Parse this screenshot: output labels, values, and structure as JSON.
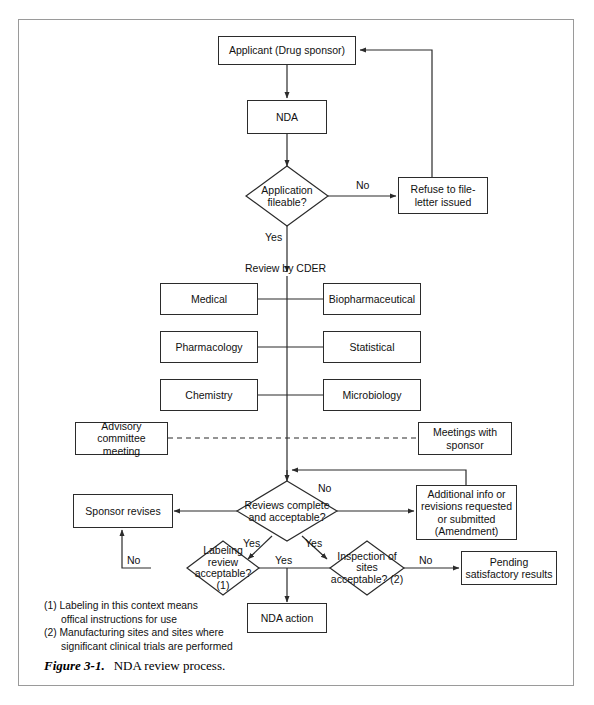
{
  "figure": {
    "number": "Figure 3-1.",
    "title": "NDA review process."
  },
  "nodes": {
    "applicant": "Applicant (Drug sponsor)",
    "nda": "NDA",
    "application_fileable": "Application fileable?",
    "refuse_to_file": "Refuse to file-letter issued",
    "review_by_cder": "Review by CDER",
    "medical": "Medical",
    "biopharmaceutical": "Biopharmaceutical",
    "pharmacology": "Pharmacology",
    "statistical": "Statistical",
    "chemistry": "Chemistry",
    "microbiology": "Microbiology",
    "advisory_committee": "Advisory committee meeting",
    "meetings_with_sponsor": "Meetings with sponsor",
    "reviews_complete": "Reviews complete and acceptable?",
    "sponsor_revises": "Sponsor revises",
    "additional_info": "Additional info or revisions requested or submitted (Amendment)",
    "labeling_review": "Labeling review acceptable? (1)",
    "inspection_of_sites": "Inspection of sites acceptable? (2)",
    "pending_results": "Pending satisfactory results",
    "nda_action": "NDA action"
  },
  "node_lines": {
    "applicant": [
      "Applicant (Drug sponsor)"
    ],
    "nda": [
      "NDA"
    ],
    "application_fileable": [
      "Application",
      "fileable?"
    ],
    "refuse_to_file": [
      "Refuse to file-",
      "letter issued"
    ],
    "medical": [
      "Medical"
    ],
    "biopharmaceutical": [
      "Biopharmaceutical"
    ],
    "pharmacology": [
      "Pharmacology"
    ],
    "statistical": [
      "Statistical"
    ],
    "chemistry": [
      "Chemistry"
    ],
    "microbiology": [
      "Microbiology"
    ],
    "advisory_committee": [
      "Advisory",
      "committee meeting"
    ],
    "meetings_with_sponsor": [
      "Meetings with",
      "sponsor"
    ],
    "reviews_complete": [
      "Reviews",
      "complete and",
      "acceptable?"
    ],
    "sponsor_revises": [
      "Sponsor revises"
    ],
    "additional_info": [
      "Additional info or",
      "revisions requested",
      "or submitted",
      "(Amendment)"
    ],
    "labeling_review": [
      "Labeling",
      "review",
      "acceptable?",
      "(1)"
    ],
    "inspection_of_sites": [
      "Inspection",
      "of sites",
      "acceptable?",
      "(2)"
    ],
    "pending_results": [
      "Pending",
      "satisfactory results"
    ],
    "nda_action": [
      "NDA action"
    ]
  },
  "edge_labels": {
    "fileable_no": "No",
    "fileable_yes": "Yes",
    "reviews_no": "No",
    "reviews_yes_left": "Yes",
    "reviews_yes_right": "Yes",
    "labeling_no": "No",
    "labeling_yes": "Yes",
    "inspection_no": "No"
  },
  "footnotes": [
    "(1) Labeling in this context means",
    "offical instructions for use",
    "(2) Manufacturing sites and sites where",
    "significant clinical trials are performed"
  ],
  "colors": {
    "line": "#2b2b2b",
    "frame": "#9a9a9a",
    "background": "#ffffff",
    "text": "#111111"
  }
}
